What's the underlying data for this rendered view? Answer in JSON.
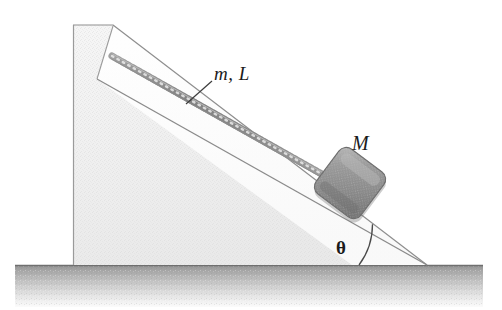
{
  "figure": {
    "width": 502,
    "height": 310,
    "background_color": "#ffffff"
  },
  "labels": {
    "rope_label": "m, L",
    "block_label": "M",
    "angle_label": "θ"
  },
  "colors": {
    "ground_dark": "#a9a9a9",
    "ground_light": "#f4f4f4",
    "wedge_fill": "#f1f1f1",
    "wedge_face_fill": "#fbfbfb",
    "wedge_stroke": "#8c8c8c",
    "block_fill": "#8e8e8e",
    "block_highlight": "#b5b5b5",
    "block_shadow": "#6e6e6e",
    "rope_color": "#9a9a9a",
    "line_color": "#4a4a4a",
    "text_color": "#1b1b1b"
  },
  "geometry": {
    "ground": {
      "x": 15,
      "y": 265,
      "width": 468,
      "height": 42
    },
    "wedge_points": "73,25 113,25 427,265 73,265",
    "incline_face_points": "97,79 113,25 427,265 345,265",
    "wall_top_left": {
      "x": 73,
      "y": 25
    },
    "wall_top_right": {
      "x": 113,
      "y": 25
    },
    "notch_corner": {
      "x": 97,
      "y": 79
    },
    "incline_bottom_tip": {
      "x": 427,
      "y": 265
    },
    "rope_anchor": {
      "x": 112,
      "y": 56
    },
    "rope_end": {
      "x": 332,
      "y": 180
    },
    "block_center": {
      "x": 350,
      "y": 183
    },
    "block_size": 56,
    "block_rotation_deg": 37,
    "angle_arc_center": {
      "x": 427,
      "y": 265
    },
    "angle_arc_radius": 68,
    "angle_degrees": 37,
    "leader_line": {
      "x1": 212,
      "y1": 81,
      "x2": 187,
      "y2": 103
    }
  }
}
